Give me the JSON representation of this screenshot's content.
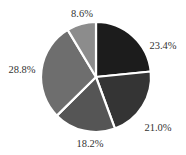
{
  "chart_data": {
    "type": "pie",
    "title": "",
    "start_angle_deg": 0,
    "direction": "clockwise",
    "categories": [
      "Slice 1",
      "Slice 2",
      "Slice 3",
      "Slice 4",
      "Slice 5"
    ],
    "values": [
      23.4,
      21.0,
      18.2,
      28.8,
      8.6
    ],
    "labels": [
      "23.4%",
      "21.0%",
      "18.2%",
      "28.8%",
      "8.6%"
    ],
    "colors": [
      "#1c1c1c",
      "#343434",
      "#555555",
      "#6e6e6e",
      "#8c8c8c"
    ],
    "legend": "none",
    "label_position": "outside"
  },
  "layout": {
    "cx": 96,
    "cy": 77,
    "r": 55,
    "label_positions": [
      {
        "x": 163,
        "y": 49,
        "anchor": "middle"
      },
      {
        "x": 158,
        "y": 131,
        "anchor": "middle"
      },
      {
        "x": 90,
        "y": 147,
        "anchor": "middle"
      },
      {
        "x": 22,
        "y": 73,
        "anchor": "middle"
      },
      {
        "x": 82,
        "y": 17,
        "anchor": "middle"
      }
    ]
  }
}
